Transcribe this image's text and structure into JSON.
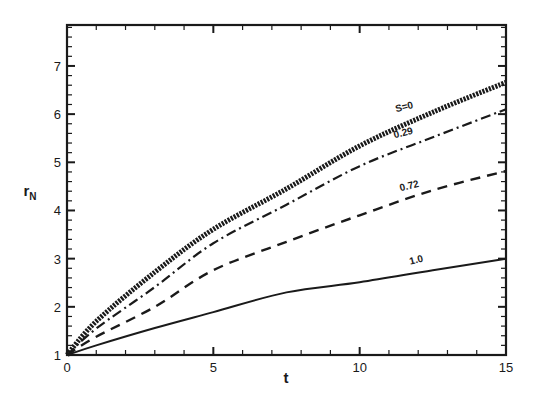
{
  "chart_data": {
    "type": "line",
    "title": "",
    "xlabel": "t",
    "ylabel": "r_N",
    "ylabel_main": "r",
    "ylabel_sub": "N",
    "xlim": [
      0,
      15
    ],
    "ylim": [
      1,
      7.85
    ],
    "xticks": [
      0,
      5,
      10,
      15
    ],
    "yticks": [
      1,
      2,
      3,
      4,
      5,
      6,
      7
    ],
    "x_minor_step": 1,
    "y_minor_step": 0.2,
    "grid": false,
    "legend": "inline curve labels",
    "x": [
      0,
      1,
      3,
      5,
      7.5,
      10,
      12.5,
      15
    ],
    "series": [
      {
        "name": "S=0",
        "label": "S=0",
        "style": "thick-dotted",
        "values": [
          1.0,
          1.7,
          2.72,
          3.61,
          4.45,
          5.34,
          6.04,
          6.66
        ],
        "label_pos": [
          405,
          110
        ]
      },
      {
        "name": "0.29",
        "label": "0.29",
        "style": "dash-dot",
        "values": [
          1.0,
          1.55,
          2.41,
          3.32,
          4.12,
          4.92,
          5.52,
          6.1
        ],
        "label_pos": [
          404,
          136
        ]
      },
      {
        "name": "0.72",
        "label": "0.72",
        "style": "dashed",
        "values": [
          1.0,
          1.38,
          2.0,
          2.76,
          3.35,
          3.9,
          4.42,
          4.82
        ],
        "label_pos": [
          410,
          189
        ]
      },
      {
        "name": "1.0",
        "label": "1.0",
        "style": "solid",
        "values": [
          1.0,
          1.2,
          1.56,
          1.89,
          2.3,
          2.51,
          2.76,
          3.0
        ],
        "label_pos": [
          417,
          263
        ]
      }
    ]
  },
  "axes": {
    "x_title": "t",
    "y_title_main": "r",
    "y_title_sub": "N",
    "x_tick_labels": [
      "0",
      "5",
      "10",
      "15"
    ],
    "y_tick_labels": [
      "1",
      "2",
      "3",
      "4",
      "5",
      "6",
      "7"
    ]
  },
  "colors": {
    "ink": "#1a1a1a",
    "background": "#ffffff"
  }
}
